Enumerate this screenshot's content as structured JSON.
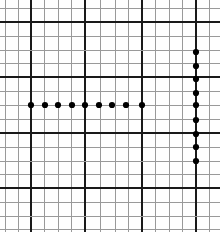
{
  "figure": {
    "width": 220,
    "height": 232,
    "background_color": "#ffffff"
  },
  "grid": {
    "major_line_color": "#1a1a1a",
    "major_line_width": 2.4,
    "minor_line_color": "#9a9a9a",
    "minor_line_width": 1.0,
    "major_x": [
      5,
      31,
      58,
      85,
      115,
      142,
      169,
      196
    ],
    "minor_x": [
      18,
      44,
      71,
      100,
      128,
      155,
      182,
      209
    ],
    "major_y": [
      22,
      50,
      77,
      105,
      133,
      161,
      188,
      216
    ],
    "minor_y": [
      8,
      36,
      63,
      91,
      119,
      147,
      174,
      202,
      229
    ],
    "major_x_line_weights": [
      "thin",
      "major",
      "thin",
      "major",
      "thin",
      "major",
      "thin",
      "major"
    ],
    "major_y_line_weights": [
      "major",
      "thin",
      "major",
      "thin",
      "major",
      "thin",
      "major",
      "thin"
    ]
  },
  "chart_data": {
    "type": "scatter",
    "title": "",
    "xlabel": "",
    "ylabel": "",
    "marker_color": "#000000",
    "marker_radius": 3.1,
    "series": [
      {
        "name": "horizontal-run",
        "orientation": "horizontal",
        "count": 9,
        "points": [
          {
            "x": 31,
            "y": 105
          },
          {
            "x": 45,
            "y": 105
          },
          {
            "x": 58,
            "y": 105
          },
          {
            "x": 72,
            "y": 105
          },
          {
            "x": 85,
            "y": 105
          },
          {
            "x": 99,
            "y": 105
          },
          {
            "x": 112,
            "y": 105
          },
          {
            "x": 126,
            "y": 105
          },
          {
            "x": 142,
            "y": 105
          }
        ]
      },
      {
        "name": "vertical-run",
        "orientation": "vertical",
        "count": 9,
        "points": [
          {
            "x": 196,
            "y": 52
          },
          {
            "x": 196,
            "y": 66
          },
          {
            "x": 196,
            "y": 79
          },
          {
            "x": 196,
            "y": 93
          },
          {
            "x": 196,
            "y": 105
          },
          {
            "x": 196,
            "y": 120
          },
          {
            "x": 196,
            "y": 134
          },
          {
            "x": 196,
            "y": 147
          },
          {
            "x": 196,
            "y": 161
          }
        ]
      }
    ]
  }
}
